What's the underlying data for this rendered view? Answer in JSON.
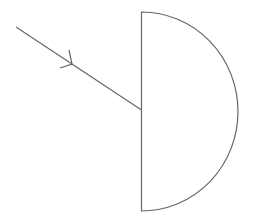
{
  "diagram": {
    "stroke_color": "#666666",
    "background": "#ffffff",
    "semicircle": {
      "flat_face_x": 141.5,
      "top_y": 12,
      "bottom_y": 211,
      "rightmost_x": 238
    },
    "incident_ray": {
      "start": [
        16,
        27
      ],
      "end": [
        141.5,
        110
      ],
      "arrow_tip": [
        72,
        64
      ],
      "arrow_barb_a": [
        69,
        50
      ],
      "arrow_barb_b": [
        60,
        68
      ]
    }
  }
}
